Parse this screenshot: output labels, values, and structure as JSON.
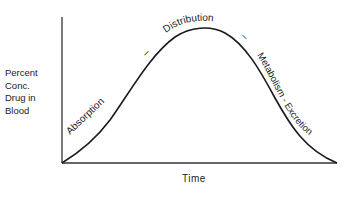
{
  "diagram": {
    "title": "",
    "y_axis_label_lines": [
      "Percent",
      "Conc.",
      "Drug in",
      "Blood"
    ],
    "x_axis_label": "Time",
    "phases": [
      {
        "name": "absorption",
        "label": "Absorption"
      },
      {
        "name": "separator-1",
        "label": "–"
      },
      {
        "name": "distribution",
        "label": "Distribution"
      },
      {
        "name": "separator-2",
        "label": "–"
      },
      {
        "name": "metabolism-excretion",
        "label": "Metabolism - Excretion"
      }
    ],
    "line_color": "#1a1a1a"
  }
}
